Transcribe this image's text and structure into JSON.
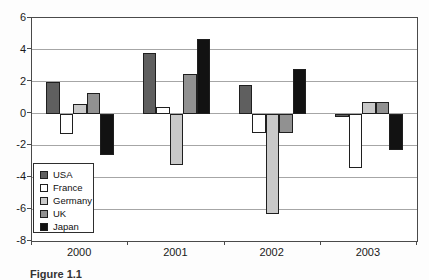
{
  "figure": {
    "caption": "Figure 1.1"
  },
  "chart_data": {
    "type": "bar",
    "title": "",
    "xlabel": "",
    "ylabel": "",
    "categories": [
      "2000",
      "2001",
      "2002",
      "2003"
    ],
    "series": [
      {
        "name": "USA",
        "color": "#5f5f5f",
        "values": [
          2.0,
          3.8,
          1.8,
          -0.2
        ]
      },
      {
        "name": "France",
        "color": "#ffffff",
        "values": [
          -1.3,
          0.4,
          -1.2,
          -3.4
        ]
      },
      {
        "name": "Germany",
        "color": "#c9c9c9",
        "values": [
          0.6,
          -3.2,
          -6.3,
          0.7
        ]
      },
      {
        "name": "UK",
        "color": "#919191",
        "values": [
          1.3,
          2.5,
          -1.2,
          0.7
        ]
      },
      {
        "name": "Japan",
        "color": "#121212",
        "values": [
          -2.6,
          4.7,
          2.8,
          -2.3
        ]
      }
    ],
    "ylim": [
      -8,
      6
    ],
    "yticks": [
      6,
      4,
      2,
      0,
      -2,
      -4,
      -6,
      -8
    ],
    "grid": true,
    "legend_position": "inside-left",
    "colors": {
      "grid": "#a6a6a6",
      "axis": "#4a4a4a",
      "bar_border": "#1f1f1f",
      "background": "#ffffff"
    }
  }
}
